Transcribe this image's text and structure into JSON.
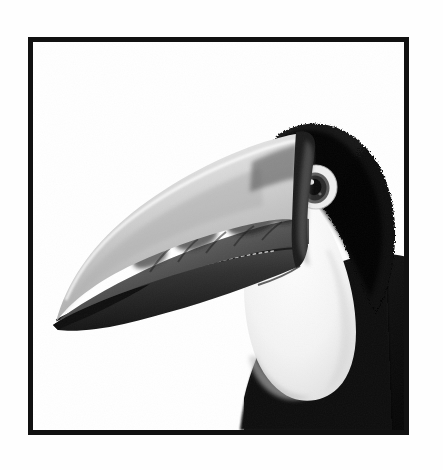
{
  "page": {
    "background_color": "#fefefe",
    "width": 443,
    "height": 470
  },
  "frame": {
    "border_color": "#111111",
    "border_width": 5,
    "inner_background": "#ffffff",
    "left": 28,
    "top": 37,
    "width": 381,
    "height": 398
  },
  "photograph": {
    "subject": "toucan",
    "style": "black-and-white photograph",
    "orientation": "head in left profile",
    "colors": {
      "black": "#0d0d0d",
      "dark_gray": "#3a3a3a",
      "mid_gray": "#7d7d7d",
      "light_gray": "#c9c9c9",
      "pale": "#e8e8e8",
      "white": "#ffffff"
    },
    "parts": {
      "beak_upper_label": "upper mandible",
      "beak_lower_label": "lower mandible",
      "cap_label": "black crown",
      "face_label": "white face and throat",
      "eye_label": "eye",
      "body_label": "black body"
    }
  }
}
